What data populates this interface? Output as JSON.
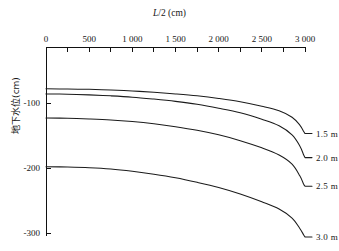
{
  "chart_data": {
    "type": "line",
    "title": "",
    "xlabel": "L/2 (cm)",
    "xlabel_parts": {
      "italic": "L",
      "rest": "/2 (cm)"
    },
    "ylabel": "地下水位(cm)",
    "xlim": [
      0,
      3000
    ],
    "ylim": [
      -300,
      -13
    ],
    "x_axis_position": "top",
    "grid": false,
    "legend": "inline-right-end-labels",
    "x_ticks_major": [
      0,
      500,
      1000,
      1500,
      2000,
      2500,
      3000
    ],
    "x_tick_labels": [
      "0",
      "500",
      "1 000",
      "1 500",
      "2 000",
      "2 500",
      "3 000"
    ],
    "x_ticks_minor": [
      250,
      750,
      1250,
      1750,
      2250,
      2750
    ],
    "y_ticks": [
      -100,
      -200,
      -300
    ],
    "y_tick_labels": [
      "-100",
      "-200",
      "-300"
    ],
    "series": [
      {
        "name": "1.5 m",
        "label": "1.5 m",
        "color": "#1b1b1b",
        "x": [
          0,
          250,
          500,
          750,
          1000,
          1250,
          1500,
          1750,
          2000,
          2250,
          2500,
          2700,
          2850,
          2940,
          2985,
          3000
        ],
        "y": [
          -78,
          -78.5,
          -79,
          -80,
          -81.5,
          -83.5,
          -86,
          -89,
          -93,
          -98,
          -105,
          -112,
          -122,
          -134,
          -144,
          -147
        ]
      },
      {
        "name": "2.0 m",
        "label": "2.0 m",
        "color": "#1b1b1b",
        "x": [
          0,
          250,
          500,
          750,
          1000,
          1250,
          1500,
          1750,
          2000,
          2250,
          2500,
          2700,
          2850,
          2940,
          2985,
          3000
        ],
        "y": [
          -86,
          -86.5,
          -87.5,
          -89,
          -91,
          -94,
          -97.5,
          -102,
          -108,
          -115,
          -125,
          -135,
          -149,
          -166,
          -180,
          -184
        ]
      },
      {
        "name": "2.5 m",
        "label": "2.5 m",
        "color": "#1b1b1b",
        "x": [
          0,
          250,
          500,
          750,
          1000,
          1250,
          1500,
          1750,
          2000,
          2250,
          2500,
          2700,
          2850,
          2940,
          2985,
          3000
        ],
        "y": [
          -123,
          -123.5,
          -124.5,
          -126,
          -128.5,
          -132,
          -136.5,
          -142,
          -149,
          -158,
          -169,
          -180,
          -194,
          -212,
          -225,
          -228
        ]
      },
      {
        "name": "3.0 m",
        "label": "3.0 m",
        "color": "#1b1b1b",
        "x": [
          0,
          250,
          500,
          750,
          1000,
          1250,
          1500,
          1750,
          2000,
          2250,
          2500,
          2700,
          2850,
          2940,
          2985,
          3000
        ],
        "y": [
          -198,
          -198.5,
          -199.5,
          -201.5,
          -205,
          -209.5,
          -215,
          -222,
          -230,
          -240,
          -252,
          -263,
          -277,
          -293,
          -303,
          -306
        ]
      }
    ]
  }
}
